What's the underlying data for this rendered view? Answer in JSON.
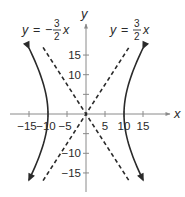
{
  "chart_data": {
    "type": "line",
    "title": "",
    "xlabel": "x",
    "ylabel": "y",
    "xlim": [
      -20,
      22
    ],
    "ylim": [
      -20,
      23
    ],
    "grid": false,
    "x_ticks": [
      -15,
      -10,
      -5,
      5,
      10,
      15
    ],
    "x_tick_labels": [
      "−15",
      "−10",
      "−5",
      "5",
      "10",
      "15"
    ],
    "y_ticks": [
      15,
      10,
      5,
      -5,
      -10,
      -15
    ],
    "y_tick_labels": [
      "15",
      "10",
      "",
      "",
      "−10",
      "−15"
    ],
    "series": [
      {
        "name": "hyperbola",
        "equation": "x^2/100 - y^2/225 = 1",
        "style": "solid",
        "branches": [
          "left",
          "right"
        ],
        "vertices": [
          [
            -10,
            0
          ],
          [
            10,
            0
          ]
        ],
        "y_range": [
          -16.8,
          16.8
        ],
        "arrows": true
      },
      {
        "name": "asymptote-negative",
        "label": "y = −3/2 x",
        "slope": -1.5,
        "style": "dashed",
        "x_range": [
          -11.3,
          11.3
        ]
      },
      {
        "name": "asymptote-positive",
        "label": "y = 3/2 x",
        "slope": 1.5,
        "style": "dashed",
        "x_range": [
          -11.3,
          11.3
        ]
      }
    ],
    "annotations": [
      {
        "text": "y = −3/2 x",
        "position": "top-left"
      },
      {
        "text": "y = 3/2 x",
        "position": "top-right"
      }
    ]
  },
  "labels": {
    "x_axis": "x",
    "y_axis": "y",
    "eq_left": {
      "lhs": "y",
      "eq": "=",
      "sign": "−",
      "num": "3",
      "den": "2",
      "var": "x"
    },
    "eq_right": {
      "lhs": "y",
      "eq": "=",
      "num": "3",
      "den": "2",
      "var": "x"
    }
  },
  "colors": {
    "ink": "#2a2a2a",
    "axis": "#8a8a8a",
    "background": "#ffffff"
  }
}
